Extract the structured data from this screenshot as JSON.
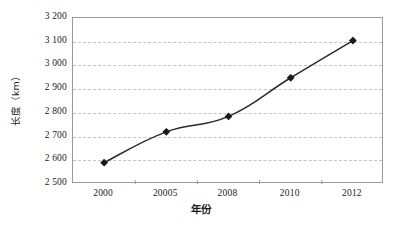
{
  "chart_data": {
    "type": "line",
    "title": "",
    "subtitle": "",
    "xlabel": "年份",
    "ylabel": "长度（km）",
    "categories": [
      "2000",
      "20005",
      "2008",
      "2010",
      "2012"
    ],
    "series": [
      {
        "name": "长度",
        "values": [
          2590,
          2720,
          2785,
          2948,
          3105
        ]
      }
    ],
    "ylim": [
      2500,
      3200
    ],
    "ytick_step": 100,
    "ytick_labels": [
      "3 200",
      "3 100",
      "3 000",
      "2 900",
      "2 800",
      "2 700",
      "2 600",
      "2 500"
    ],
    "ytick_values": [
      3200,
      3100,
      3000,
      2900,
      2800,
      2700,
      2600,
      2500
    ],
    "grid": "horizontal-dashed",
    "legend": "none",
    "marker": "diamond",
    "line_color": "#2b2b2b",
    "marker_color": "#1a1a1a",
    "grid_color": "#b9c6d4",
    "frame_color": "#9a9a9a",
    "background_color": "#ffffff",
    "annotations": []
  }
}
